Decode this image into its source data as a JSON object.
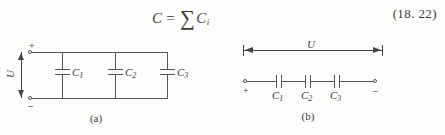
{
  "equation": {
    "lhs": "C",
    "operator": "=",
    "sigma": "∑",
    "rhs_symbol": "C",
    "rhs_subscript": "i",
    "number": "(18. 22)"
  },
  "figure_a": {
    "caption": "(a)",
    "voltage_label": "U",
    "plus_sign": "+",
    "minus_sign": "–",
    "capacitors": [
      {
        "symbol": "C",
        "subscript": "1"
      },
      {
        "symbol": "C",
        "subscript": "2"
      },
      {
        "symbol": "C",
        "subscript": "3"
      }
    ]
  },
  "figure_b": {
    "caption": "(b)",
    "voltage_label": "U",
    "plus_sign": "+",
    "minus_sign": "–",
    "capacitors": [
      {
        "symbol": "C",
        "subscript": "1"
      },
      {
        "symbol": "C",
        "subscript": "2"
      },
      {
        "symbol": "C",
        "subscript": "3"
      }
    ]
  },
  "colors": {
    "ink": "#3a3a3a",
    "wire": "#555555",
    "background": "#fdfdfb"
  }
}
